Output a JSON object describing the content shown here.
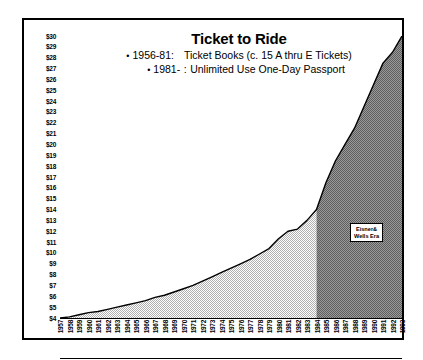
{
  "chart_data": {
    "type": "area",
    "title": "Ticket to Ride",
    "subtitle_bullets": [
      {
        "dot": "•",
        "era": "1956-81:",
        "colon": "",
        "text": "Ticket Books  (c. 15 A thru E Tickets)"
      },
      {
        "dot": "•",
        "era": "1981-",
        "colon": ":",
        "text": "Unlimited Use One-Day Passport"
      }
    ],
    "xlabel": "",
    "ylabel": "",
    "ylim": [
      4,
      30
    ],
    "xlim": [
      1957,
      1993
    ],
    "grid": false,
    "legend_position": "none",
    "y_tick_labels": [
      "$30",
      "$29",
      "$28",
      "$27",
      "$26",
      "$25",
      "$24",
      "$23",
      "$22",
      "$21",
      "$20",
      "$19",
      "$18",
      "$17",
      "$16",
      "$15",
      "$14",
      "$13",
      "$12",
      "$11",
      "$10",
      "$9",
      "$8",
      "$7",
      "$6",
      "$5",
      "$4"
    ],
    "y_tick_values": [
      30,
      29,
      28,
      27,
      26,
      25,
      24,
      23,
      22,
      21,
      20,
      19,
      18,
      17,
      16,
      15,
      14,
      13,
      12,
      11,
      10,
      9,
      8,
      7,
      6,
      5,
      4
    ],
    "categories": [
      "1957",
      "1958",
      "1959",
      "1960",
      "1961",
      "1962",
      "1963",
      "1964",
      "1965",
      "1966",
      "1967",
      "1968",
      "1969",
      "1970",
      "1971",
      "1972",
      "1973",
      "1974",
      "1975",
      "1976",
      "1977",
      "1978",
      "1979",
      "1980",
      "1981",
      "1982",
      "1983",
      "1984",
      "1985",
      "1986",
      "1987",
      "1988",
      "1989",
      "1990",
      "1991",
      "1992",
      "1993"
    ],
    "values": [
      4.0,
      4.1,
      4.3,
      4.5,
      4.6,
      4.8,
      5.0,
      5.2,
      5.4,
      5.6,
      5.9,
      6.1,
      6.4,
      6.7,
      7.0,
      7.4,
      7.8,
      8.2,
      8.6,
      9.0,
      9.4,
      9.9,
      10.4,
      11.3,
      12.0,
      12.2,
      13.0,
      14.0,
      16.5,
      18.5,
      20.0,
      21.5,
      23.5,
      25.5,
      27.5,
      28.5,
      30.0
    ],
    "series": [
      {
        "name": "Ticket Books Era",
        "fill": "light-hatch",
        "start": "1957",
        "end": "1984"
      },
      {
        "name": "Eisner & Wells Era",
        "fill": "dark-hatch",
        "start": "1984",
        "end": "1993"
      }
    ],
    "annotations": [
      {
        "name": "era-label",
        "line1": "Eisner&",
        "line2": "Wells Era",
        "x": "1990",
        "y": 13
      }
    ],
    "colors": {
      "line": "#000000",
      "light_fill": "#d9d9d9",
      "dark_fill": "#8c8c8c",
      "border": "#000000",
      "background": "#ffffff"
    }
  }
}
